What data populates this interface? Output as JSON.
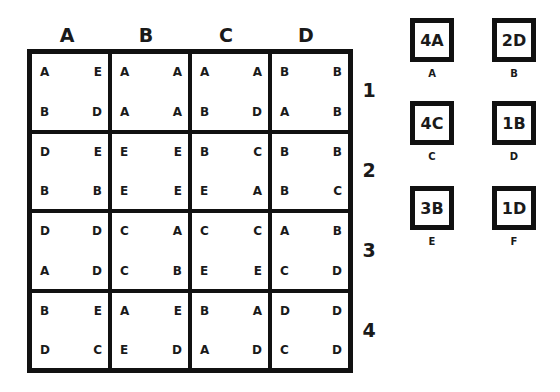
{
  "puzzle": {
    "columns": [
      "A",
      "B",
      "C",
      "D"
    ],
    "rows": [
      "1",
      "2",
      "3",
      "4"
    ],
    "cells": [
      [
        [
          "A",
          "E",
          "B",
          "D"
        ],
        [
          "A",
          "A",
          "A",
          "A"
        ],
        [
          "A",
          "A",
          "B",
          "D"
        ],
        [
          "B",
          "B",
          "A",
          "B"
        ]
      ],
      [
        [
          "D",
          "E",
          "B",
          "B"
        ],
        [
          "E",
          "E",
          "E",
          "E"
        ],
        [
          "B",
          "C",
          "E",
          "A"
        ],
        [
          "B",
          "B",
          "B",
          "C"
        ]
      ],
      [
        [
          "D",
          "D",
          "A",
          "D"
        ],
        [
          "C",
          "A",
          "C",
          "B"
        ],
        [
          "C",
          "C",
          "E",
          "E"
        ],
        [
          "A",
          "B",
          "C",
          "D"
        ]
      ],
      [
        [
          "B",
          "E",
          "D",
          "C"
        ],
        [
          "A",
          "E",
          "E",
          "D"
        ],
        [
          "B",
          "A",
          "A",
          "D"
        ],
        [
          "D",
          "D",
          "C",
          "D"
        ]
      ]
    ]
  },
  "answers": [
    {
      "code": "4A",
      "label": "A"
    },
    {
      "code": "2D",
      "label": "B"
    },
    {
      "code": "4C",
      "label": "C"
    },
    {
      "code": "1B",
      "label": "D"
    },
    {
      "code": "3B",
      "label": "E"
    },
    {
      "code": "1D",
      "label": "F"
    }
  ]
}
